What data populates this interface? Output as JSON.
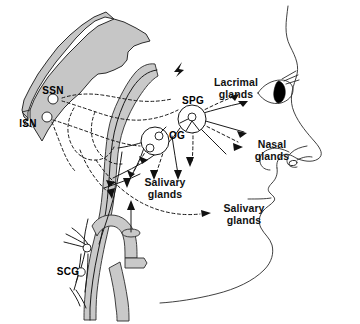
{
  "figure": {
    "domain": "diagram",
    "canvas": {
      "width": 360,
      "height": 324,
      "background": "#ffffff"
    }
  },
  "colors": {
    "background": "#ffffff",
    "line": "#1a1a1a",
    "face_outline": "#2b2b2b",
    "vessel_gray": "#c9c9c9",
    "brainstem_gray": "#c6c6c6",
    "ganglion_fill": "#ffffff",
    "pupil_black": "#000000",
    "label_text": "#111111"
  },
  "labels": {
    "ssn": "SSN",
    "isn": "ISN",
    "spg": "SPG",
    "og": "OG",
    "scg": "SCG",
    "lacrimal_line1": "Lacrimal",
    "lacrimal_line2": "glands",
    "nasal_line1": "Nasal",
    "nasal_line2": "glands",
    "salivary_upper_line1": "Salivary",
    "salivary_upper_line2": "glands",
    "salivary_lower_line1": "Salivary",
    "salivary_lower_line2": "glands"
  },
  "structures": {
    "brainstem": "shaded brainstem / skull base wedge, upper left",
    "carotid_artery": "gray tubular internal carotid artery running vertically through center",
    "carotid_bifurcation": "carotid bifurcation with cut vessel stump at lower center",
    "face_profile": "right-facing human head profile outline with eye, nose, lips and chin",
    "eye": "eye with dark almond pupil and lashes",
    "nostril": "nostril outline inside nose",
    "ganglia": [
      {
        "name": "superior-salivatory-nucleus",
        "abbr": "SSN"
      },
      {
        "name": "inferior-salivatory-nucleus",
        "abbr": "ISN"
      },
      {
        "name": "sphenopalatine-ganglion",
        "abbr": "SPG"
      },
      {
        "name": "otic-ganglion",
        "abbr": "OG"
      },
      {
        "name": "superior-cervical-ganglion",
        "abbr": "SCG"
      }
    ]
  },
  "legend_note": {
    "solid_lines": "solid lines: sympathetic / postganglionic fibres",
    "dashed_lines": "dashed lines: parasympathetic fibres"
  }
}
